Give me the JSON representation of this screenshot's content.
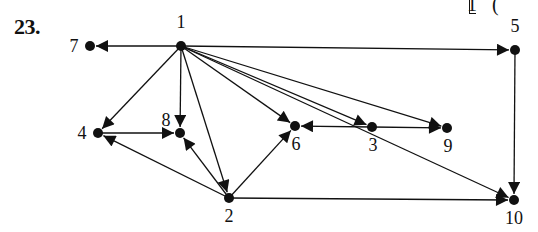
{
  "problem": {
    "number": "23.",
    "corner_fragment": "1   (",
    "corner_bracket": "⌊"
  },
  "graph": {
    "directed": true,
    "nodes": [
      {
        "id": "1",
        "label": "1",
        "x": 181,
        "y": 46,
        "lx": 181,
        "ly": 28,
        "anchor": "middle"
      },
      {
        "id": "2",
        "label": "2",
        "x": 229,
        "y": 198,
        "lx": 229,
        "ly": 222,
        "anchor": "middle"
      },
      {
        "id": "3",
        "label": "3",
        "x": 372,
        "y": 127,
        "lx": 373,
        "ly": 151,
        "anchor": "middle"
      },
      {
        "id": "4",
        "label": "4",
        "x": 98,
        "y": 133,
        "lx": 82,
        "ly": 139,
        "anchor": "middle"
      },
      {
        "id": "5",
        "label": "5",
        "x": 515,
        "y": 50,
        "lx": 515,
        "ly": 32,
        "anchor": "middle"
      },
      {
        "id": "6",
        "label": "6",
        "x": 295,
        "y": 126,
        "lx": 296,
        "ly": 150,
        "anchor": "middle"
      },
      {
        "id": "7",
        "label": "7",
        "x": 90,
        "y": 46,
        "lx": 74,
        "ly": 52,
        "anchor": "middle"
      },
      {
        "id": "8",
        "label": "8",
        "x": 180,
        "y": 133,
        "lx": 166,
        "ly": 126,
        "anchor": "middle"
      },
      {
        "id": "9",
        "label": "9",
        "x": 447,
        "y": 128,
        "lx": 448,
        "ly": 152,
        "anchor": "middle"
      },
      {
        "id": "10",
        "label": "10",
        "x": 514,
        "y": 200,
        "lx": 514,
        "ly": 224,
        "anchor": "middle"
      }
    ],
    "edges": [
      {
        "from": "1",
        "to": "7"
      },
      {
        "from": "1",
        "to": "5"
      },
      {
        "from": "1",
        "to": "4"
      },
      {
        "from": "1",
        "to": "8"
      },
      {
        "from": "1",
        "to": "2"
      },
      {
        "from": "1",
        "to": "6"
      },
      {
        "from": "1",
        "to": "3"
      },
      {
        "from": "1",
        "to": "9"
      },
      {
        "from": "1",
        "to": "10"
      },
      {
        "from": "4",
        "to": "8"
      },
      {
        "from": "2",
        "to": "4"
      },
      {
        "from": "2",
        "to": "8"
      },
      {
        "from": "2",
        "to": "6"
      },
      {
        "from": "2",
        "to": "10"
      },
      {
        "from": "3",
        "to": "6"
      },
      {
        "from": "3",
        "to": "9"
      },
      {
        "from": "5",
        "to": "10"
      }
    ],
    "style": {
      "line_color": "#111111",
      "node_color": "#111111",
      "node_radius": 5
    }
  }
}
